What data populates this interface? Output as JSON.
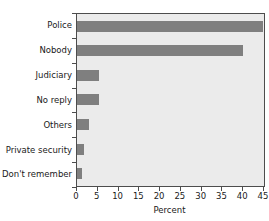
{
  "clipped_header_text": "",
  "colors": {
    "bar_fill": "#7f7f7f",
    "plot_background": "#ebebeb",
    "axis_line": "#4d4d4d",
    "text": "#1a1a1a",
    "page_background": "#ffffff"
  },
  "chart_data": {
    "type": "bar",
    "orientation": "horizontal",
    "title": "",
    "subtitle": "",
    "xlabel": "Percent",
    "ylabel": "",
    "categories": [
      "Police",
      "Nobody",
      "Judiciary",
      "No reply",
      "Others",
      "Private security",
      "Don't remember"
    ],
    "values": [
      44.8,
      40.0,
      5.2,
      5.2,
      2.9,
      1.6,
      1.3
    ],
    "xlim": [
      0,
      45
    ],
    "xticks": [
      0,
      5,
      10,
      15,
      20,
      25,
      30,
      35,
      40,
      45
    ],
    "xticklabels": [
      "0",
      "5",
      "10",
      "15",
      "20",
      "25",
      "30",
      "35",
      "40",
      "45"
    ],
    "grid": false,
    "legend": null,
    "legend_position": "none",
    "annotations": []
  }
}
